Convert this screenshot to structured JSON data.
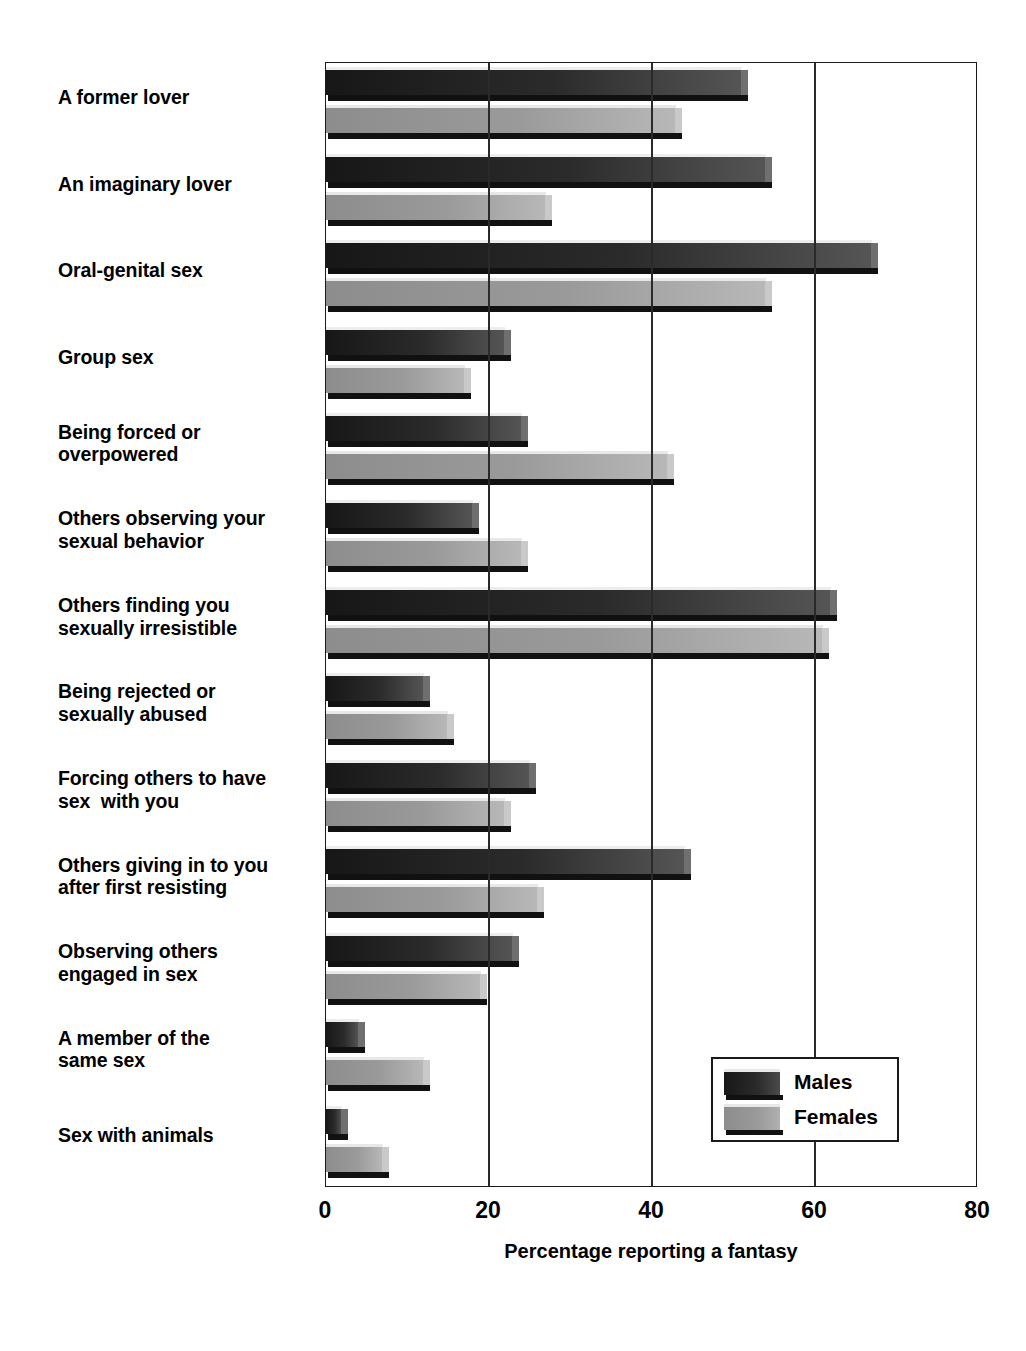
{
  "chart_data": {
    "type": "bar",
    "orientation": "horizontal",
    "title": "",
    "xlabel": "Percentage reporting a fantasy",
    "ylabel": "",
    "xlim": [
      0,
      80
    ],
    "xticks": [
      0,
      20,
      40,
      60,
      80
    ],
    "xtick_labels": [
      "0",
      "20",
      "40",
      "60",
      "80"
    ],
    "grid": "vertical",
    "legend_position": "bottom-right",
    "categories": [
      "A former lover",
      "An imaginary lover",
      "Oral-genital sex",
      "Group sex",
      "Being forced or\noverpowered",
      "Others observing your\nsexual behavior",
      "Others finding you\nsexually irresistible",
      "Being rejected or\nsexually abused",
      "Forcing others to have\nsex  with you",
      "Others giving in to you\nafter first resisting",
      "Observing others\nengaged in sex",
      "A member of the\nsame sex",
      "Sex with animals"
    ],
    "series": [
      {
        "name": "Males",
        "color": "#262626",
        "values": [
          51,
          54,
          67,
          22,
          24,
          18,
          62,
          12,
          25,
          44,
          23,
          4,
          2
        ]
      },
      {
        "name": "Females",
        "color": "#9a9a9a",
        "values": [
          43,
          27,
          54,
          17,
          42,
          24,
          61,
          15,
          22,
          26,
          19,
          12,
          7
        ]
      }
    ]
  },
  "legend": {
    "items": [
      {
        "label": "Males"
      },
      {
        "label": "Females"
      }
    ]
  },
  "axis": {
    "x_title": "Percentage reporting a fantasy"
  }
}
